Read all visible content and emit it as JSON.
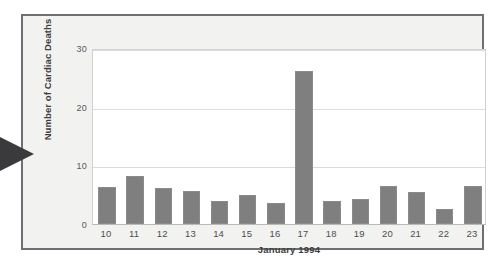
{
  "figure": {
    "arrow_marker": "left-pointer-arrow",
    "frame_color": "#6f6f73",
    "bar_color": "#807f7f",
    "plot_background": "#ffffff",
    "figure_background": "#f2f2f0"
  },
  "chart_data": {
    "type": "bar",
    "title": "",
    "subtitle": "",
    "xlabel": "January 1994",
    "ylabel": "Number of Cardiac Deaths",
    "categories": [
      "10",
      "11",
      "12",
      "13",
      "14",
      "15",
      "16",
      "17",
      "18",
      "19",
      "20",
      "21",
      "22",
      "23"
    ],
    "values": [
      6.3,
      8.2,
      6.1,
      5.7,
      4.0,
      5.0,
      3.5,
      26.0,
      4.0,
      4.2,
      6.5,
      5.5,
      2.5,
      6.5
    ],
    "series": [
      {
        "name": "Number of Cardiac Deaths",
        "values": [
          6.3,
          8.2,
          6.1,
          5.7,
          4.0,
          5.0,
          3.5,
          26.0,
          4.0,
          4.2,
          6.5,
          5.5,
          2.5,
          6.5
        ]
      }
    ],
    "ylim": [
      0,
      30
    ],
    "yticks": [
      0,
      10,
      20,
      30
    ],
    "ytick_labels": [
      "0",
      "10",
      "20",
      "30"
    ],
    "xtick_labels": [
      "10",
      "11",
      "12",
      "13",
      "14",
      "15",
      "16",
      "17",
      "18",
      "19",
      "20",
      "21",
      "22",
      "23"
    ],
    "grid": true,
    "grid_axis": "y",
    "legend": false,
    "legend_position": "none",
    "annotations": []
  }
}
